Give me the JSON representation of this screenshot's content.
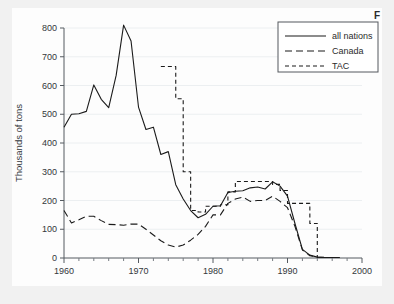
{
  "figure": {
    "caption_stub": "F",
    "background_color": "#f1f1f1",
    "panel_color": "#fdfdfd"
  },
  "chart_data": {
    "type": "line",
    "title": "",
    "subtitle": "",
    "xlabel": "",
    "ylabel": "Thousands of tons",
    "xlim": [
      1960,
      2000
    ],
    "ylim": [
      0,
      800
    ],
    "xticks": [
      1960,
      1970,
      1980,
      1990,
      2000
    ],
    "xtick_labels": [
      "1960",
      "1970",
      "1980",
      "1990",
      "2000"
    ],
    "xminor_step": 2,
    "yticks": [
      0,
      100,
      200,
      300,
      400,
      500,
      600,
      700,
      800
    ],
    "ytick_labels": [
      "0",
      "100",
      "200",
      "300",
      "400",
      "500",
      "600",
      "700",
      "800"
    ],
    "grid": "horizontal-light",
    "legend_position": "top-right",
    "line_color": "#1b1b1b",
    "series": [
      {
        "name": "all nations",
        "style": "solid",
        "x": [
          1960,
          1961,
          1962,
          1963,
          1964,
          1965,
          1966,
          1967,
          1968,
          1969,
          1970,
          1971,
          1972,
          1973,
          1974,
          1975,
          1976,
          1977,
          1978,
          1979,
          1980,
          1981,
          1982,
          1983,
          1984,
          1985,
          1986,
          1987,
          1988,
          1989,
          1990,
          1991,
          1992,
          1993,
          1994,
          1995,
          1996,
          1997
        ],
        "values": [
          455,
          500,
          502,
          510,
          602,
          552,
          523,
          635,
          810,
          755,
          525,
          447,
          455,
          360,
          370,
          255,
          205,
          165,
          140,
          152,
          180,
          182,
          228,
          232,
          234,
          244,
          247,
          240,
          265,
          250,
          215,
          120,
          30,
          10,
          3,
          2,
          2,
          2
        ]
      },
      {
        "name": "Canada",
        "style": "dashed-long",
        "x": [
          1960,
          1961,
          1962,
          1963,
          1964,
          1965,
          1966,
          1967,
          1968,
          1969,
          1970,
          1971,
          1972,
          1973,
          1974,
          1975,
          1976,
          1977,
          1978,
          1979,
          1980,
          1981,
          1982,
          1983,
          1984,
          1985,
          1986,
          1987,
          1988,
          1989,
          1990,
          1991,
          1992,
          1993,
          1994,
          1995,
          1996,
          1997
        ],
        "values": [
          165,
          122,
          133,
          145,
          145,
          130,
          117,
          116,
          114,
          118,
          118,
          100,
          80,
          60,
          45,
          38,
          45,
          62,
          82,
          110,
          150,
          150,
          190,
          205,
          212,
          197,
          200,
          200,
          215,
          197,
          175,
          110,
          28,
          8,
          3,
          2,
          2,
          2
        ]
      },
      {
        "name": "TAC",
        "style": "dashed-short",
        "x": [
          1973,
          1974,
          1975,
          1976,
          1977,
          1978,
          1979,
          1980,
          1981,
          1982,
          1983,
          1984,
          1985,
          1986,
          1987,
          1988,
          1989,
          1990,
          1991,
          1992,
          1993,
          1994
        ],
        "values": [
          666,
          666,
          554,
          300,
          165,
          160,
          180,
          180,
          185,
          230,
          266,
          266,
          266,
          266,
          266,
          256,
          235,
          190,
          190,
          190,
          120,
          0
        ]
      }
    ],
    "legend_entries": [
      {
        "label": "all nations",
        "style": "solid"
      },
      {
        "label": "Canada",
        "style": "dashed-long"
      },
      {
        "label": "TAC",
        "style": "dashed-short"
      }
    ]
  }
}
